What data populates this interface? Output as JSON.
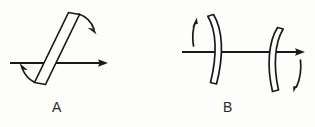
{
  "figure": {
    "background_color": "#fdfdfb",
    "ink_color": "#1a1a1a",
    "width": 315,
    "height": 127,
    "panels": [
      {
        "id": "A",
        "label": "A",
        "label_x": 57,
        "label_y": 112,
        "element_type": "tilted-plate",
        "element_description": "thin flat optical plate tilted from lower-left to upper-right, crossed by the beam axis",
        "beam_axis": {
          "name": "optical-axis",
          "x1": 10,
          "y1": 63,
          "x2": 108,
          "y2": 63,
          "arrowhead": "right"
        },
        "plate": {
          "top_outer_x": 79,
          "top_outer_y": 12,
          "bottom_outer_x": 45,
          "bottom_outer_y": 84,
          "thickness": 11,
          "tilt_degrees": 25
        },
        "motion_arrows": [
          {
            "name": "rotation-arrow-upper-right",
            "direction": "down-right",
            "meaning": "tilt of plate, clockwise"
          },
          {
            "name": "rotation-arrow-lower-left",
            "direction": "down-left",
            "meaning": "tilt of plate, opposite end"
          }
        ]
      },
      {
        "id": "B",
        "label": "B",
        "label_x": 228,
        "label_y": 112,
        "element_type": "curved-mirror-pair",
        "element_description": "two concave curved mirrors facing each other forming a resonator cavity on the beam axis",
        "beam_axis": {
          "name": "optical-axis",
          "x1": 182,
          "y1": 52,
          "x2": 305,
          "y2": 52,
          "arrowhead": "right"
        },
        "mirrors": [
          {
            "name": "left-mirror",
            "top_x": 218,
            "top_y": 15,
            "bottom_x": 212,
            "bottom_y": 85,
            "bulge": "right",
            "thickness": 6
          },
          {
            "name": "right-mirror",
            "top_x": 276,
            "top_y": 27,
            "bottom_x": 270,
            "bottom_y": 92,
            "bulge": "left",
            "thickness": 6
          }
        ],
        "motion_arrows": [
          {
            "name": "translation-arrow-up-left",
            "direction": "up",
            "meaning": "left mirror displacement upward"
          },
          {
            "name": "translation-arrow-down-right",
            "direction": "down",
            "meaning": "right mirror displacement downward"
          }
        ]
      }
    ]
  }
}
